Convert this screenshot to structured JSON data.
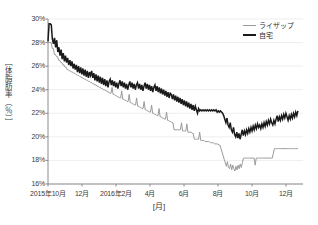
{
  "chart_data": {
    "type": "line",
    "title": "",
    "xlabel": "[月]",
    "ylabel": "［体脂肪率（％）］",
    "ylim": [
      16,
      30
    ],
    "ytick_labels": [
      "30%",
      "28%",
      "26%",
      "24%",
      "22%",
      "20%",
      "18%",
      "16%"
    ],
    "ytick_values": [
      30,
      28,
      26,
      24,
      22,
      20,
      18,
      16
    ],
    "xtick_labels": [
      "2015年10月",
      "12月",
      "2016年2月",
      "4月",
      "6月",
      "8月",
      "10月",
      "12月"
    ],
    "xtick_positions": [
      0,
      2,
      4,
      6,
      8,
      10,
      12,
      14
    ],
    "xlim": [
      0,
      15
    ],
    "grid": true,
    "legend_position": "top-right",
    "legend": [
      "ライザップ",
      "自宅"
    ],
    "colors": {
      "raizap": "#9a9a9a",
      "jitaku": "#1a1a1a",
      "grid": "#e2e2e2",
      "axis": "#808080",
      "text": "#3a3a3a"
    },
    "series": [
      {
        "name": "自宅",
        "color": "#1a1a1a",
        "width": 1.5,
        "values": [
          28.1,
          29.6,
          29.6,
          29.5,
          28.3,
          27.9,
          28.4,
          27.6,
          28.2,
          27.2,
          27.6,
          26.9,
          27.4,
          26.6,
          27.1,
          26.4,
          26.9,
          26.3,
          26.7,
          26.1,
          26.5,
          26.0,
          26.4,
          25.8,
          26.2,
          25.7,
          26.1,
          25.5,
          26.0,
          25.4,
          25.9,
          25.3,
          25.8,
          25.2,
          25.7,
          25.1,
          25.6,
          25.0,
          25.5,
          25.2,
          25.6,
          25.0,
          25.4,
          24.8,
          25.3,
          24.7,
          25.2,
          24.6,
          25.1,
          24.5,
          25.0,
          24.4,
          24.9,
          24.3,
          24.8,
          24.2,
          24.7,
          24.9,
          24.4,
          24.8,
          24.3,
          24.7,
          24.2,
          24.6,
          24.1,
          24.5,
          24.8,
          24.3,
          24.7,
          24.2,
          24.6,
          24.1,
          24.5,
          24.0,
          24.4,
          24.7,
          24.2,
          24.6,
          24.1,
          24.5,
          24.0,
          24.4,
          24.6,
          24.1,
          24.5,
          24.0,
          24.4,
          23.9,
          24.3,
          24.6,
          24.1,
          24.5,
          24.0,
          24.4,
          23.9,
          24.3,
          23.8,
          24.2,
          24.4,
          23.9,
          24.3,
          23.8,
          24.2,
          23.7,
          24.1,
          23.6,
          24.0,
          23.5,
          23.9,
          23.4,
          23.8,
          23.3,
          23.7,
          23.6,
          23.2,
          23.6,
          23.1,
          23.5,
          23.0,
          23.4,
          22.9,
          23.3,
          22.8,
          23.2,
          22.7,
          23.1,
          22.6,
          23.0,
          22.5,
          22.9,
          22.4,
          22.8,
          22.3,
          22.7,
          22.2,
          22.6,
          22.3,
          22.0,
          22.4,
          22.2,
          22.3,
          22.2,
          22.3,
          22.2,
          22.3,
          22.2,
          22.3,
          22.2,
          22.3,
          22.2,
          22.3,
          22.2,
          22.3,
          22.2,
          22.3,
          22.1,
          22.2,
          22.1,
          22.2,
          22.1,
          22.0,
          21.8,
          21.5,
          21.2,
          21.6,
          21.0,
          20.8,
          21.2,
          20.6,
          20.4,
          20.8,
          20.2,
          20.0,
          20.4,
          19.9,
          20.3,
          19.8,
          20.2,
          20.6,
          20.1,
          20.5,
          20.2,
          20.6,
          20.3,
          20.7,
          20.4,
          20.8,
          20.5,
          20.9,
          20.6,
          21.0,
          20.7,
          21.1,
          20.8,
          21.0,
          20.7,
          21.1,
          20.8,
          21.2,
          20.9,
          21.3,
          21.0,
          21.4,
          21.1,
          21.5,
          21.2,
          21.0,
          21.4,
          21.1,
          21.5,
          21.8,
          21.3,
          21.7,
          21.4,
          21.8,
          21.5,
          21.9,
          21.6,
          22.0,
          21.7,
          21.4,
          21.8,
          21.5,
          21.9,
          21.6,
          22.0,
          21.7,
          22.1,
          21.8,
          22.2
        ]
      },
      {
        "name": "ライザップ",
        "color": "#9a9a9a",
        "width": 1.0,
        "values": [
          28.0,
          28.0,
          28.0,
          28.0,
          27.5,
          27.5,
          27.0,
          27.0,
          26.8,
          26.8,
          26.5,
          26.5,
          26.3,
          26.3,
          26.1,
          26.1,
          25.9,
          25.9,
          25.7,
          25.7,
          25.6,
          25.6,
          25.5,
          25.5,
          25.4,
          25.4,
          25.3,
          25.3,
          25.2,
          25.2,
          25.1,
          25.1,
          25.0,
          25.0,
          24.9,
          24.9,
          24.8,
          24.8,
          24.7,
          24.7,
          24.6,
          24.6,
          24.5,
          24.5,
          24.4,
          24.4,
          24.3,
          24.3,
          24.2,
          24.2,
          24.1,
          24.1,
          24.0,
          24.0,
          23.9,
          23.9,
          23.8,
          23.8,
          23.7,
          23.7,
          24.2,
          23.6,
          23.6,
          23.5,
          23.5,
          23.4,
          23.4,
          23.3,
          23.3,
          23.9,
          23.2,
          23.2,
          23.1,
          23.1,
          23.0,
          23.0,
          23.6,
          22.9,
          22.9,
          22.8,
          22.8,
          22.7,
          22.7,
          23.3,
          22.6,
          22.6,
          22.5,
          22.5,
          22.4,
          22.4,
          23.0,
          22.3,
          22.3,
          22.2,
          22.2,
          22.1,
          22.1,
          22.7,
          22.0,
          22.0,
          21.9,
          21.9,
          21.8,
          21.8,
          22.4,
          21.7,
          21.7,
          21.6,
          21.6,
          21.5,
          21.5,
          22.1,
          21.4,
          21.4,
          21.3,
          21.3,
          21.2,
          21.2,
          20.6,
          20.6,
          20.6,
          20.6,
          20.6,
          20.6,
          20.6,
          21.2,
          20.5,
          20.5,
          20.5,
          20.5,
          21.1,
          20.4,
          20.4,
          20.4,
          20.4,
          20.3,
          20.3,
          19.8,
          19.8,
          19.8,
          19.8,
          19.8,
          20.4,
          19.7,
          19.7,
          19.7,
          19.7,
          19.6,
          19.6,
          19.6,
          19.6,
          19.6,
          19.5,
          19.5,
          19.5,
          19.5,
          19.4,
          19.4,
          19.4,
          19.4,
          19.3,
          19.3,
          19.0,
          18.7,
          18.4,
          18.1,
          17.8,
          17.5,
          17.9,
          17.4,
          17.3,
          17.7,
          17.2,
          17.6,
          17.3,
          17.1,
          17.5,
          17.2,
          17.6,
          17.3,
          17.7,
          17.4,
          17.8,
          18.2,
          18.2,
          18.2,
          18.2,
          18.2,
          18.2,
          18.2,
          18.2,
          18.2,
          18.2,
          18.2,
          17.6,
          18.2,
          18.2,
          18.2,
          18.2,
          18.2,
          18.2,
          18.2,
          18.2,
          18.2,
          18.2,
          18.2,
          18.2,
          18.2,
          18.2,
          18.2,
          18.2,
          18.6,
          19.0,
          19.0,
          19.0,
          19.0,
          19.0,
          19.0,
          19.0,
          19.0,
          19.0,
          19.0,
          19.0,
          19.0,
          19.0,
          19.0,
          19.0,
          19.0,
          19.0,
          19.0,
          19.0,
          19.0,
          19.0,
          19.0,
          19.0
        ]
      }
    ]
  },
  "plot": {
    "left": 48,
    "right": 303,
    "top": 19,
    "bottom": 184
  }
}
